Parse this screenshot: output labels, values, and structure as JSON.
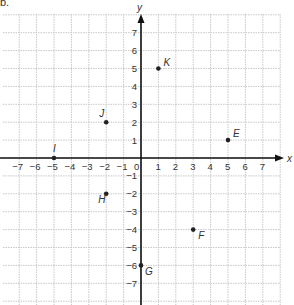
{
  "part_label": "b.",
  "chart_data": {
    "type": "scatter",
    "title": "",
    "xlabel": "x",
    "ylabel": "y",
    "xlim": [
      -8,
      8
    ],
    "ylim": [
      -8,
      8
    ],
    "grid": true,
    "x_ticks": [
      -7,
      -6,
      -5,
      -4,
      -3,
      -2,
      -1,
      0,
      1,
      2,
      3,
      4,
      5,
      6,
      7
    ],
    "y_ticks": [
      -7,
      -6,
      -5,
      -4,
      -3,
      -2,
      -1,
      1,
      2,
      3,
      4,
      5,
      6,
      7
    ],
    "points": [
      {
        "label": "K",
        "x": 1,
        "y": 5
      },
      {
        "label": "J",
        "x": -2,
        "y": 2
      },
      {
        "label": "E",
        "x": 5,
        "y": 1
      },
      {
        "label": "I",
        "x": -5,
        "y": 0
      },
      {
        "label": "H",
        "x": -2,
        "y": -2
      },
      {
        "label": "F",
        "x": 3,
        "y": -4
      },
      {
        "label": "G",
        "x": 0,
        "y": -6
      }
    ]
  },
  "colors": {
    "axis": "#111111",
    "grid": "#c8c8c8",
    "point": "#222222",
    "text": "#333333"
  }
}
